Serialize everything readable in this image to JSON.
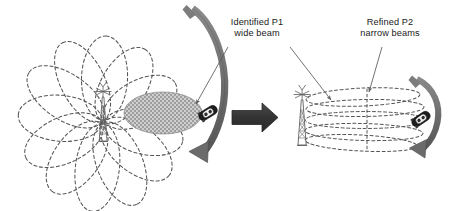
{
  "figure": {
    "type": "beam-management-diagram",
    "background_color": "#ffffff",
    "annotations": {
      "p1": {
        "text": "Identified P1\nwide beam",
        "line1": "Identified P1",
        "line2": "wide beam"
      },
      "p2": {
        "text": "Refined P2\nnarrow beams",
        "line1": "Refined P2",
        "line2": "narrow beams"
      }
    },
    "left_panel": {
      "name": "p1-wide-beam-sweep",
      "tower": {
        "name": "cell-tower-left",
        "cx": 103,
        "cy": 120
      },
      "wide_beam_count": 12,
      "highlighted_beam": {
        "name": "identified-wide-beam",
        "fill": "#b0b0b0",
        "pattern": "checker-hatch",
        "cx": 163,
        "cy": 113,
        "rx": 38,
        "ry": 21
      },
      "vehicle": {
        "name": "vehicle-left",
        "cx": 208,
        "cy": 113
      },
      "sweep_arrow": {
        "name": "beam-sweep-arrow-left",
        "color": "#6e6e6e"
      },
      "beam_outline_color": "#555555",
      "beam_style": "dashed"
    },
    "transition_arrow": {
      "name": "transition-arrow",
      "direction": "right",
      "color": "#404040"
    },
    "right_panel": {
      "name": "p2-narrow-beam-refinement",
      "tower": {
        "name": "cell-tower-right",
        "cx": 302,
        "cy": 121
      },
      "narrow_beam_count": 5,
      "vehicle": {
        "name": "vehicle-right",
        "cx": 420,
        "cy": 119
      },
      "sweep_arrow": {
        "name": "beam-sweep-arrow-right",
        "color": "#6e6e6e"
      },
      "beam_outline_color": "#555555",
      "beam_style": "dashed"
    },
    "colors": {
      "beam_outline": "#555555",
      "highlight_fill": "#b4b4b4",
      "arrow_gray": "#6e6e6e",
      "arrow_dark": "#3a3a3a",
      "text": "#1a1a1a",
      "tower": "#666666",
      "vehicle": "#1f1f1f"
    }
  }
}
